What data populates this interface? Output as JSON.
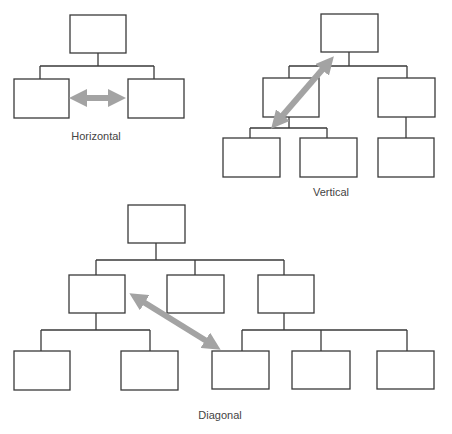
{
  "diagrams": [
    {
      "id": "horizontal",
      "label": "Horizontal",
      "label_pos": [
        96,
        130
      ]
    },
    {
      "id": "vertical",
      "label": "Vertical",
      "label_pos": [
        331,
        186
      ]
    },
    {
      "id": "diagonal",
      "label": "Diagonal",
      "label_pos": [
        220,
        409
      ]
    }
  ],
  "colors": {
    "box_stroke": "#3a3a3a",
    "arrow": "#a3a3a3",
    "background": "#ffffff"
  }
}
